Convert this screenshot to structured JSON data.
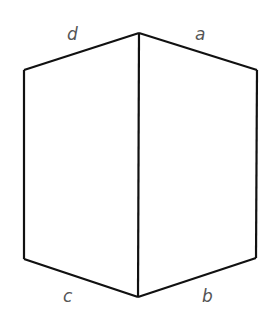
{
  "diagram": {
    "type": "folded-rectangle-prism",
    "stroke_color": "#111111",
    "label_color": "#555555",
    "vertices": {
      "top": [
        139,
        33
      ],
      "top_left": [
        24,
        70
      ],
      "top_right": [
        257,
        70
      ],
      "bottom_left": [
        24,
        259
      ],
      "bottom": [
        138,
        297
      ],
      "bottom_right": [
        256,
        258
      ]
    },
    "labels": {
      "d": "d",
      "a": "a",
      "c": "c",
      "b": "b"
    }
  }
}
